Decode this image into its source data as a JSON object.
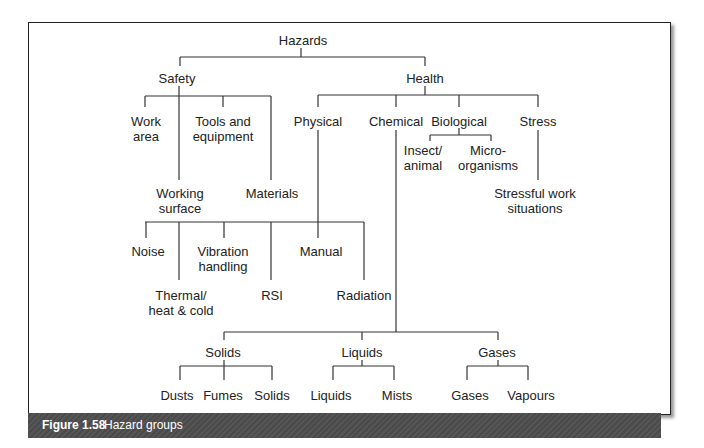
{
  "figure": {
    "label": "Figure 1.58",
    "title": "Hazard groups"
  },
  "nodes": [
    {
      "id": "hazards",
      "text": "Hazards",
      "x": 303,
      "y": 33
    },
    {
      "id": "safety",
      "text": "Safety",
      "x": 177,
      "y": 71
    },
    {
      "id": "health",
      "text": "Health",
      "x": 425,
      "y": 71
    },
    {
      "id": "work-area",
      "text": "Work\narea",
      "x": 146,
      "y": 114
    },
    {
      "id": "tools",
      "text": "Tools and\nequipment",
      "x": 223,
      "y": 114
    },
    {
      "id": "physical",
      "text": "Physical",
      "x": 318,
      "y": 114
    },
    {
      "id": "chemical",
      "text": "Chemical",
      "x": 396,
      "y": 114
    },
    {
      "id": "biological",
      "text": "Biological",
      "x": 459,
      "y": 114
    },
    {
      "id": "stress",
      "text": "Stress",
      "x": 538,
      "y": 114
    },
    {
      "id": "insect",
      "text": "Insect/\nanimal",
      "x": 423,
      "y": 143
    },
    {
      "id": "micro",
      "text": "Micro-\norganisms",
      "x": 488,
      "y": 143
    },
    {
      "id": "working-surface",
      "text": "Working\nsurface",
      "x": 180,
      "y": 186
    },
    {
      "id": "materials",
      "text": "Materials",
      "x": 272,
      "y": 186
    },
    {
      "id": "stressful",
      "text": "Stressful work\nsituations",
      "x": 535,
      "y": 186
    },
    {
      "id": "noise",
      "text": "Noise",
      "x": 148,
      "y": 244
    },
    {
      "id": "vibration",
      "text": "Vibration\nhandling",
      "x": 223,
      "y": 244
    },
    {
      "id": "manual",
      "text": "Manual",
      "x": 321,
      "y": 244
    },
    {
      "id": "thermal",
      "text": "Thermal/\nheat & cold",
      "x": 181,
      "y": 288
    },
    {
      "id": "rsi",
      "text": "RSI",
      "x": 272,
      "y": 288
    },
    {
      "id": "radiation",
      "text": "Radiation",
      "x": 364,
      "y": 288
    },
    {
      "id": "solids",
      "text": "Solids",
      "x": 223,
      "y": 345
    },
    {
      "id": "liquids",
      "text": "Liquids",
      "x": 362,
      "y": 345
    },
    {
      "id": "gases",
      "text": "Gases",
      "x": 497,
      "y": 345
    },
    {
      "id": "dusts",
      "text": "Dusts",
      "x": 177,
      "y": 388
    },
    {
      "id": "fumes",
      "text": "Fumes",
      "x": 223,
      "y": 388
    },
    {
      "id": "solids2",
      "text": "Solids",
      "x": 272,
      "y": 388
    },
    {
      "id": "liquids2",
      "text": "Liquids",
      "x": 331,
      "y": 388
    },
    {
      "id": "mists",
      "text": "Mists",
      "x": 397,
      "y": 388
    },
    {
      "id": "gases2",
      "text": "Gases",
      "x": 470,
      "y": 388
    },
    {
      "id": "vapours",
      "text": "Vapours",
      "x": 531,
      "y": 388
    }
  ],
  "lines": [
    [
      301,
      48,
      301,
      57
    ],
    [
      180,
      57,
      425,
      57
    ],
    [
      180,
      57,
      180,
      66
    ],
    [
      425,
      57,
      425,
      66
    ],
    [
      179,
      86,
      179,
      180
    ],
    [
      145,
      96,
      271,
      96
    ],
    [
      145,
      96,
      145,
      107
    ],
    [
      223,
      96,
      223,
      107
    ],
    [
      271,
      96,
      271,
      180
    ],
    [
      425,
      86,
      425,
      95
    ],
    [
      318,
      95,
      538,
      95
    ],
    [
      318,
      95,
      318,
      107
    ],
    [
      396,
      95,
      396,
      107
    ],
    [
      459,
      95,
      459,
      107
    ],
    [
      538,
      95,
      538,
      107
    ],
    [
      459,
      128,
      459,
      135
    ],
    [
      430,
      135,
      491,
      135
    ],
    [
      430,
      135,
      430,
      141
    ],
    [
      491,
      135,
      491,
      141
    ],
    [
      538,
      130,
      538,
      180
    ],
    [
      318,
      130,
      318,
      222
    ],
    [
      145,
      222,
      364,
      222
    ],
    [
      146,
      222,
      146,
      238
    ],
    [
      179,
      222,
      179,
      280
    ],
    [
      224,
      222,
      224,
      238
    ],
    [
      271,
      222,
      271,
      280
    ],
    [
      318,
      222,
      318,
      238
    ],
    [
      364,
      222,
      364,
      280
    ],
    [
      396,
      130,
      396,
      332
    ],
    [
      224,
      332,
      498,
      332
    ],
    [
      224,
      332,
      224,
      340
    ],
    [
      362,
      332,
      362,
      340
    ],
    [
      498,
      332,
      498,
      340
    ],
    [
      224,
      360,
      224,
      366
    ],
    [
      180,
      366,
      272,
      366
    ],
    [
      180,
      366,
      180,
      380
    ],
    [
      224,
      366,
      224,
      380
    ],
    [
      272,
      366,
      272,
      380
    ],
    [
      362,
      360,
      362,
      366
    ],
    [
      333,
      366,
      394,
      366
    ],
    [
      333,
      366,
      333,
      380
    ],
    [
      394,
      366,
      394,
      380
    ],
    [
      498,
      360,
      498,
      366
    ],
    [
      467,
      366,
      528,
      366
    ],
    [
      467,
      366,
      467,
      380
    ],
    [
      528,
      366,
      528,
      380
    ]
  ]
}
